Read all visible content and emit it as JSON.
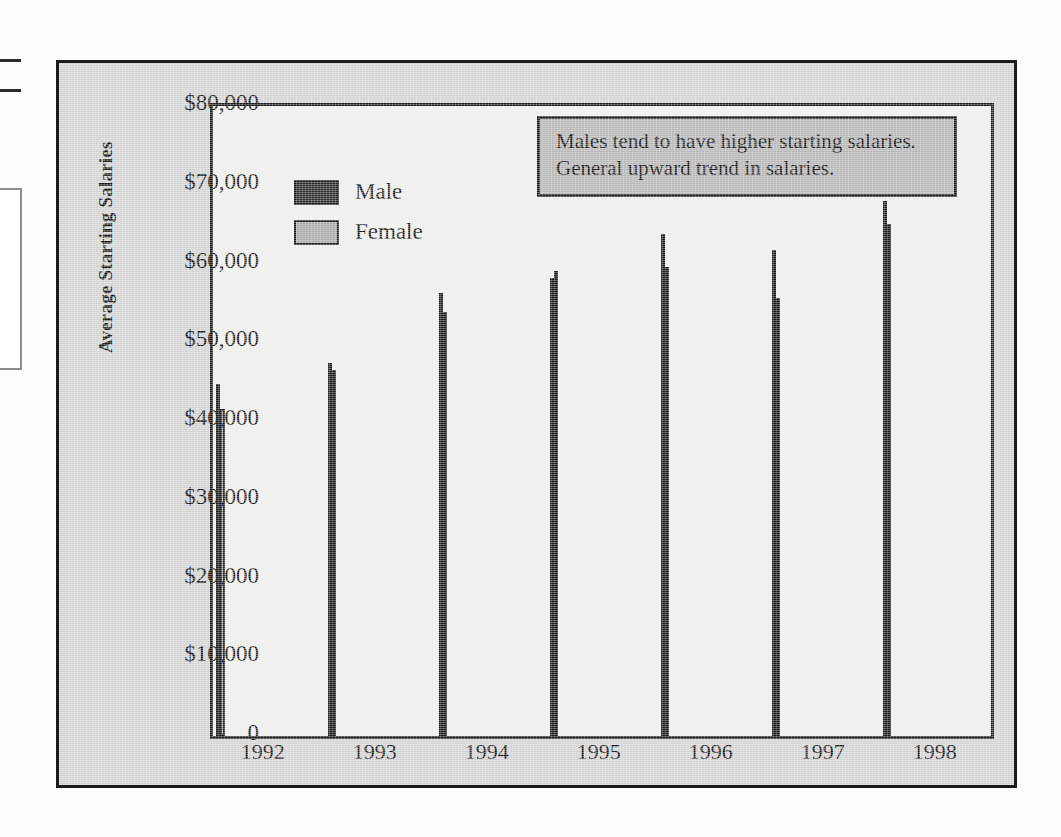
{
  "chart_data": {
    "type": "bar",
    "title": "",
    "xlabel": "",
    "ylabel": "Average Starting Salaries",
    "categories": [
      "1992",
      "1993",
      "1994",
      "1995",
      "1996",
      "1997",
      "1998"
    ],
    "series": [
      {
        "name": "Male",
        "values": [
          44700,
          47400,
          56300,
          58200,
          63800,
          61700,
          68000
        ]
      },
      {
        "name": "Female",
        "values": [
          41500,
          46500,
          53900,
          59000,
          59500,
          55600,
          65000
        ]
      }
    ],
    "ylim": [
      0,
      80000
    ],
    "ytick_values": [
      0,
      10000,
      20000,
      30000,
      40000,
      50000,
      60000,
      70000,
      80000
    ],
    "ytick_labels": [
      "0",
      "$10,000",
      "$20,000",
      "$30,000",
      "$40,000",
      "$50,000",
      "$60,000",
      "$70,000",
      "$80,000"
    ],
    "grid": false,
    "legend_position": "upper-left-inside",
    "annotations": [
      "Males tend to have higher starting salaries.",
      "General upward trend in salaries."
    ],
    "colors": {
      "male": "#2a2a2a",
      "female": "#a8a8a8",
      "plot_background": "#ededeb",
      "figure_background": "#d2d2d2",
      "annotation_background": "#b4b4b4",
      "axis": "#1c1c1c",
      "text": "#141414"
    }
  },
  "legend": {
    "items": [
      {
        "label": "Male",
        "swatch": "male"
      },
      {
        "label": "Female",
        "swatch": "female"
      }
    ]
  }
}
